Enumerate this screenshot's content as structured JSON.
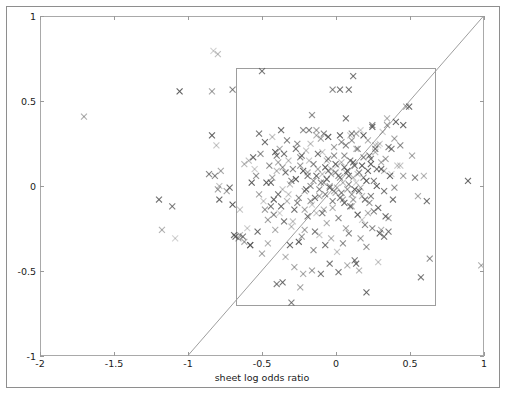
{
  "figure": {
    "background": "#ffffff",
    "frame_color": "#8e8e8e",
    "caption_fragment": ""
  },
  "chart_data": {
    "type": "scatter",
    "title": "",
    "xlabel": "sheet log odds ratio",
    "ylabel": "helix log odds ratio",
    "xlim": [
      -2,
      1
    ],
    "ylim": [
      -1,
      1
    ],
    "xticks": [
      -2,
      -1.5,
      -1,
      -0.5,
      0,
      0.5,
      1
    ],
    "xticklabels": [
      "-2",
      "-1.5",
      "-1",
      "-0.5",
      "0",
      "0.5",
      "1"
    ],
    "yticks": [
      -1,
      -0.5,
      0,
      0.5,
      1
    ],
    "yticklabels": [
      "-1",
      "-0.5",
      "0",
      "0.5",
      "1"
    ],
    "grid": false,
    "legend": null,
    "marker": "x",
    "marker_color": "#555555",
    "marker_size": 6,
    "marker_alpha_range": [
      0.25,
      0.95
    ],
    "reference_line": {
      "label": "y = x",
      "x": [
        -1,
        1
      ],
      "y": [
        -1,
        1
      ],
      "color": "#9d9d9d",
      "width": 1
    },
    "highlight_rect": {
      "label": "central region",
      "x0": -0.68,
      "y0": -0.7,
      "x1": 0.67,
      "y1": 0.7,
      "edge_color": "#9d9d9d",
      "fill": "none"
    },
    "points": [
      [
        -1.71,
        0.41
      ],
      [
        -1.2,
        -0.08
      ],
      [
        -1.11,
        -0.12
      ],
      [
        -1.18,
        -0.26
      ],
      [
        -1.09,
        -0.31
      ],
      [
        -1.06,
        0.56
      ],
      [
        -0.84,
        0.56
      ],
      [
        -0.7,
        0.57
      ],
      [
        -0.83,
        0.8
      ],
      [
        -0.8,
        0.78
      ],
      [
        -0.86,
        0.07
      ],
      [
        -0.82,
        0.06
      ],
      [
        -0.79,
        0.0
      ],
      [
        -0.84,
        0.3
      ],
      [
        -0.81,
        0.24
      ],
      [
        -0.78,
        0.09
      ],
      [
        -0.8,
        -0.02
      ],
      [
        -0.79,
        -0.08
      ],
      [
        -0.74,
        -0.03
      ],
      [
        -0.72,
        -0.01
      ],
      [
        -0.7,
        -0.11
      ],
      [
        -0.69,
        -0.29
      ],
      [
        -0.68,
        -0.3
      ],
      [
        -0.66,
        -0.31
      ],
      [
        -0.65,
        -0.14
      ],
      [
        -0.62,
        -0.33
      ],
      [
        -0.58,
        -0.35
      ],
      [
        -0.62,
        0.13
      ],
      [
        -0.59,
        0.15
      ],
      [
        -0.56,
        0.17
      ],
      [
        -0.55,
        0.1
      ],
      [
        -0.54,
        0.06
      ],
      [
        -0.52,
        0.31
      ],
      [
        -0.5,
        0.68
      ],
      [
        -0.52,
        -0.05
      ],
      [
        -0.49,
        -0.09
      ],
      [
        -0.47,
        0.02
      ],
      [
        -0.45,
        0.12
      ],
      [
        -0.44,
        -0.12
      ],
      [
        -0.43,
        0.05
      ],
      [
        -0.42,
        -0.17
      ],
      [
        -0.41,
        0.2
      ],
      [
        -0.4,
        0.18
      ],
      [
        -0.39,
        -0.05
      ],
      [
        -0.38,
        0.22
      ],
      [
        -0.37,
        0.33
      ],
      [
        -0.36,
        -0.02
      ],
      [
        -0.35,
        -0.21
      ],
      [
        -0.34,
        0.08
      ],
      [
        -0.33,
        -0.09
      ],
      [
        -0.32,
        0.15
      ],
      [
        -0.31,
        0.01
      ],
      [
        -0.3,
        -0.24
      ],
      [
        -0.29,
        0.1
      ],
      [
        -0.28,
        -0.14
      ],
      [
        -0.27,
        0.04
      ],
      [
        -0.26,
        0.25
      ],
      [
        -0.25,
        -0.07
      ],
      [
        -0.24,
        0.17
      ],
      [
        -0.23,
        -0.3
      ],
      [
        -0.22,
        0.09
      ],
      [
        -0.21,
        -0.03
      ],
      [
        -0.2,
        0.21
      ],
      [
        -0.19,
        -0.18
      ],
      [
        -0.18,
        0.33
      ],
      [
        -0.17,
        0.0
      ],
      [
        -0.16,
        -0.11
      ],
      [
        -0.15,
        0.13
      ],
      [
        -0.14,
        -0.27
      ],
      [
        -0.13,
        0.06
      ],
      [
        -0.12,
        0.19
      ],
      [
        -0.11,
        -0.06
      ],
      [
        -0.1,
        0.28
      ],
      [
        -0.09,
        -0.16
      ],
      [
        -0.08,
        0.02
      ],
      [
        -0.07,
        0.11
      ],
      [
        -0.06,
        -0.22
      ],
      [
        -0.05,
        0.16
      ],
      [
        -0.04,
        -0.01
      ],
      [
        -0.03,
        0.07
      ],
      [
        -0.02,
        -0.13
      ],
      [
        -0.01,
        0.23
      ],
      [
        0.0,
        -0.04
      ],
      [
        0.01,
        0.12
      ],
      [
        0.02,
        -0.19
      ],
      [
        0.03,
        0.05
      ],
      [
        0.04,
        0.26
      ],
      [
        0.05,
        -0.08
      ],
      [
        0.06,
        0.18
      ],
      [
        0.07,
        -0.25
      ],
      [
        0.08,
        0.09
      ],
      [
        0.09,
        0.01
      ],
      [
        0.1,
        0.3
      ],
      [
        0.11,
        -0.12
      ],
      [
        0.12,
        0.14
      ],
      [
        0.13,
        -0.02
      ],
      [
        0.14,
        0.22
      ],
      [
        0.15,
        -0.17
      ],
      [
        0.16,
        0.08
      ],
      [
        0.17,
        0.33
      ],
      [
        0.18,
        -0.06
      ],
      [
        0.19,
        0.17
      ],
      [
        0.2,
        -0.23
      ],
      [
        0.21,
        0.03
      ],
      [
        0.22,
        0.27
      ],
      [
        0.23,
        -0.1
      ],
      [
        0.24,
        0.13
      ],
      [
        0.25,
        0.36
      ],
      [
        0.26,
        -0.15
      ],
      [
        0.27,
        0.2
      ],
      [
        0.28,
        0.0
      ],
      [
        0.29,
        0.24
      ],
      [
        0.3,
        -0.28
      ],
      [
        0.31,
        0.1
      ],
      [
        0.32,
        0.32
      ],
      [
        0.33,
        -0.03
      ],
      [
        0.34,
        0.16
      ],
      [
        0.35,
        0.4
      ],
      [
        0.36,
        -0.19
      ],
      [
        0.37,
        0.06
      ],
      [
        0.38,
        0.22
      ],
      [
        0.39,
        -0.08
      ],
      [
        0.4,
        0.28
      ],
      [
        0.42,
        0.12
      ],
      [
        0.44,
        0.24
      ],
      [
        0.46,
        0.36
      ],
      [
        0.48,
        0.47
      ],
      [
        0.5,
        0.47
      ],
      [
        0.52,
        0.18
      ],
      [
        0.54,
        0.05
      ],
      [
        0.56,
        -0.06
      ],
      [
        0.58,
        -0.54
      ],
      [
        0.6,
        0.06
      ],
      [
        0.62,
        -0.09
      ],
      [
        0.64,
        -0.43
      ],
      [
        0.9,
        0.03
      ],
      [
        0.99,
        -0.47
      ],
      [
        -0.6,
        -0.25
      ],
      [
        -0.57,
        0.02
      ],
      [
        -0.53,
        -0.27
      ],
      [
        -0.51,
        0.19
      ],
      [
        -0.48,
        0.26
      ],
      [
        -0.46,
        -0.2
      ],
      [
        -0.43,
        0.29
      ],
      [
        -0.41,
        -0.26
      ],
      [
        -0.39,
        0.14
      ],
      [
        -0.37,
        -0.12
      ],
      [
        -0.35,
        0.19
      ],
      [
        -0.33,
        0.27
      ],
      [
        -0.31,
        -0.35
      ],
      [
        -0.29,
        -0.21
      ],
      [
        -0.27,
        0.22
      ],
      [
        -0.25,
        -0.33
      ],
      [
        -0.23,
        0.18
      ],
      [
        -0.21,
        -0.26
      ],
      [
        -0.19,
        0.06
      ],
      [
        -0.17,
        0.25
      ],
      [
        -0.15,
        -0.38
      ],
      [
        -0.13,
        0.3
      ],
      [
        -0.11,
        -0.29
      ],
      [
        -0.09,
        0.2
      ],
      [
        -0.07,
        -0.35
      ],
      [
        -0.05,
        0.29
      ],
      [
        -0.03,
        -0.31
      ],
      [
        -0.01,
        0.18
      ],
      [
        0.01,
        -0.39
      ],
      [
        0.03,
        0.3
      ],
      [
        0.05,
        -0.34
      ],
      [
        0.07,
        0.24
      ],
      [
        0.09,
        -0.28
      ],
      [
        0.11,
        0.27
      ],
      [
        0.13,
        -0.44
      ],
      [
        0.15,
        0.22
      ],
      [
        0.17,
        -0.31
      ],
      [
        0.19,
        0.3
      ],
      [
        0.21,
        -0.36
      ],
      [
        0.23,
        0.18
      ],
      [
        0.25,
        -0.25
      ],
      [
        0.27,
        0.22
      ],
      [
        0.29,
        -0.45
      ],
      [
        0.31,
        0.14
      ],
      [
        0.33,
        -0.3
      ],
      [
        -0.34,
        -0.42
      ],
      [
        -0.28,
        -0.48
      ],
      [
        -0.22,
        -0.52
      ],
      [
        -0.16,
        -0.5
      ],
      [
        -0.1,
        -0.52
      ],
      [
        -0.04,
        -0.46
      ],
      [
        0.02,
        -0.51
      ],
      [
        0.08,
        -0.47
      ],
      [
        0.14,
        -0.46
      ],
      [
        0.16,
        -0.5
      ],
      [
        -0.3,
        -0.69
      ],
      [
        -0.24,
        -0.6
      ],
      [
        -0.4,
        -0.58
      ],
      [
        -0.36,
        -0.57
      ],
      [
        0.21,
        -0.63
      ],
      [
        -0.5,
        -0.4
      ],
      [
        -0.46,
        -0.34
      ],
      [
        -0.58,
        -0.35
      ],
      [
        -0.63,
        -0.3
      ],
      [
        -0.65,
        -0.29
      ],
      [
        -0.02,
        0.57
      ],
      [
        0.03,
        0.57
      ],
      [
        0.09,
        0.57
      ],
      [
        0.12,
        0.65
      ],
      [
        0.07,
        0.4
      ],
      [
        -0.16,
        0.42
      ],
      [
        -0.13,
        0.33
      ],
      [
        -0.22,
        0.33
      ],
      [
        -0.08,
        0.31
      ],
      [
        0.11,
        0.31
      ],
      [
        0.14,
        0.31
      ],
      [
        0.25,
        0.35
      ],
      [
        0.35,
        0.36
      ],
      [
        0.41,
        0.38
      ],
      [
        0.27,
        0.24
      ],
      [
        0.3,
        0.25
      ],
      [
        0.36,
        0.23
      ],
      [
        0.33,
        0.09
      ],
      [
        0.38,
        0.07
      ],
      [
        0.44,
        0.12
      ],
      [
        0.29,
        -0.13
      ],
      [
        0.34,
        -0.18
      ],
      [
        0.31,
        -0.26
      ],
      [
        0.36,
        -0.27
      ],
      [
        0.4,
        -0.01
      ],
      [
        0.46,
        0.06
      ],
      [
        -0.44,
        0.02
      ],
      [
        -0.42,
        -0.08
      ],
      [
        -0.38,
        -0.16
      ],
      [
        -0.48,
        -0.14
      ],
      [
        -0.4,
        0.09
      ],
      [
        -0.36,
        0.11
      ],
      [
        -0.32,
        -0.05
      ],
      [
        -0.3,
        0.03
      ],
      [
        -0.26,
        -0.1
      ],
      [
        -0.24,
        0.12
      ],
      [
        -0.2,
        -0.02
      ],
      [
        -0.18,
        0.15
      ],
      [
        -0.14,
        -0.07
      ],
      [
        -0.12,
        0.1
      ],
      [
        -0.08,
        -0.14
      ],
      [
        -0.06,
        0.04
      ],
      [
        -0.02,
        -0.09
      ],
      [
        0.0,
        0.08
      ],
      [
        0.04,
        -0.04
      ],
      [
        0.06,
        0.11
      ],
      [
        0.1,
        -0.12
      ],
      [
        0.12,
        0.05
      ],
      [
        0.16,
        -0.03
      ],
      [
        0.18,
        0.12
      ],
      [
        0.2,
        -0.08
      ],
      [
        0.22,
        0.09
      ],
      [
        0.24,
        -0.06
      ],
      [
        0.26,
        0.03
      ],
      [
        0.28,
        0.1
      ],
      [
        0.05,
        0.02
      ],
      [
        0.08,
        -0.02
      ],
      [
        0.02,
        0.06
      ],
      [
        -0.01,
        -0.03
      ],
      [
        -0.04,
        0.0
      ],
      [
        0.03,
        -0.07
      ],
      [
        0.0,
        0.13
      ],
      [
        0.06,
        -0.1
      ],
      [
        -0.05,
        0.09
      ],
      [
        0.09,
        0.06
      ],
      [
        0.11,
        -0.05
      ],
      [
        0.14,
        0.02
      ],
      [
        0.17,
        -0.01
      ],
      [
        0.19,
        0.05
      ],
      [
        -0.07,
        -0.05
      ],
      [
        -0.1,
        0.02
      ],
      [
        -0.03,
        0.1
      ],
      [
        0.01,
        -0.01
      ],
      [
        0.04,
        0.14
      ],
      [
        0.07,
        0.08
      ],
      [
        -0.09,
        0.07
      ],
      [
        -0.11,
        -0.02
      ],
      [
        0.12,
        -0.08
      ],
      [
        0.15,
        0.07
      ],
      [
        -0.06,
        0.15
      ],
      [
        0.1,
        0.15
      ],
      [
        0.13,
        0.12
      ],
      [
        -0.15,
        0.03
      ],
      [
        -0.17,
        -0.09
      ],
      [
        -0.19,
        0.08
      ],
      [
        0.22,
        -0.16
      ],
      [
        0.24,
        0.16
      ],
      [
        -0.21,
        -0.14
      ],
      [
        -0.13,
        -0.16
      ],
      [
        0.18,
        -0.2
      ]
    ]
  }
}
